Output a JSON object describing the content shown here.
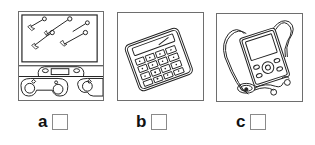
{
  "options": [
    {
      "letter": "a",
      "image": "video-game-console-icon",
      "checked": false
    },
    {
      "letter": "b",
      "image": "calculator-icon",
      "checked": false
    },
    {
      "letter": "c",
      "image": "mp3-player-icon",
      "checked": false
    }
  ],
  "colors": {
    "line": "#222222",
    "frame_border": "#6e6e6e",
    "checkbox_border": "#8a8a8a"
  }
}
